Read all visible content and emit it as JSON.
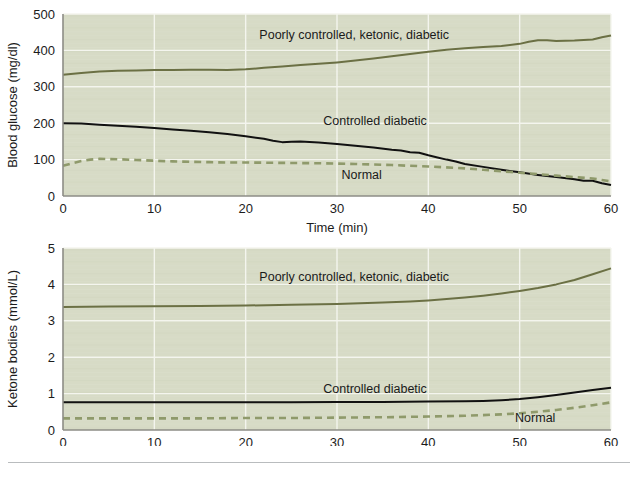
{
  "figure": {
    "background_color": "#ffffff",
    "plot_background_color": "#d7dbc6",
    "gridline_color": "#f4f5ee",
    "axis_color": "#8d8d86",
    "footer_rule_color": "#b9bcbe"
  },
  "series_styles": {
    "poorly_controlled": {
      "color": "#6b7044",
      "width": 2.0,
      "dash": "none"
    },
    "controlled": {
      "color": "#111111",
      "width": 2.0,
      "dash": "none"
    },
    "normal": {
      "color": "#8f9a6b",
      "width": 2.6,
      "dash": "7,5"
    }
  },
  "chart_data": [
    {
      "type": "line",
      "title": "",
      "xlabel": "Time (min)",
      "ylabel": "Blood glucose (mg/dl)",
      "xlim": [
        0,
        60
      ],
      "ylim": [
        0,
        500
      ],
      "xticks": [
        0,
        10,
        20,
        30,
        40,
        50,
        60
      ],
      "yticks": [
        0,
        100,
        200,
        300,
        400,
        500
      ],
      "xtick_labels": [
        "0",
        "10",
        "20",
        "30",
        "40",
        "50",
        "60"
      ],
      "ytick_labels": [
        "0",
        "100",
        "200",
        "300",
        "400",
        "500"
      ],
      "grid": true,
      "grid_axis": "both",
      "legend": "inline-annotations",
      "annotations": [
        {
          "text": "Poorly controlled, ketonic, diabetic",
          "x": 21.5,
          "y": 432,
          "series": "poorly_controlled"
        },
        {
          "text": "Controlled diabetic",
          "x": 28.5,
          "y": 196,
          "series": "controlled"
        },
        {
          "text": "Normal",
          "x": 30.5,
          "y": 48,
          "series": "normal"
        }
      ],
      "series": [
        {
          "name": "Poorly controlled, ketonic, diabetic",
          "style": "poorly_controlled",
          "x": [
            0,
            2,
            4,
            6,
            8,
            10,
            12,
            14,
            16,
            18,
            20,
            22,
            24,
            26,
            28,
            30,
            32,
            34,
            36,
            38,
            40,
            42,
            44,
            46,
            48,
            50,
            51,
            52,
            53,
            54,
            56,
            58,
            59,
            60
          ],
          "values": [
            333,
            338,
            342,
            344,
            345,
            346,
            346,
            347,
            347,
            346,
            348,
            352,
            356,
            360,
            363,
            367,
            372,
            378,
            384,
            390,
            396,
            402,
            406,
            409,
            412,
            418,
            424,
            428,
            428,
            426,
            427,
            430,
            436,
            441
          ]
        },
        {
          "name": "Controlled diabetic",
          "style": "controlled",
          "x": [
            0,
            2,
            4,
            6,
            8,
            10,
            12,
            14,
            16,
            18,
            20,
            22,
            23,
            24,
            25,
            26,
            28,
            30,
            32,
            34,
            36,
            37,
            38,
            39,
            40,
            41,
            42,
            43,
            44,
            46,
            48,
            50,
            52,
            54,
            56,
            57,
            58,
            59,
            60
          ],
          "values": [
            200,
            199,
            196,
            193,
            190,
            187,
            183,
            179,
            175,
            170,
            164,
            157,
            152,
            148,
            149,
            150,
            147,
            143,
            138,
            133,
            127,
            125,
            120,
            119,
            112,
            106,
            100,
            95,
            88,
            80,
            72,
            65,
            58,
            52,
            46,
            42,
            42,
            35,
            30
          ]
        },
        {
          "name": "Normal",
          "style": "normal",
          "x": [
            0,
            1,
            2,
            3,
            4,
            6,
            8,
            10,
            12,
            14,
            16,
            18,
            20,
            24,
            28,
            32,
            36,
            40,
            44,
            46,
            48,
            50,
            52,
            54,
            56,
            58,
            59,
            60
          ],
          "values": [
            83,
            90,
            96,
            100,
            102,
            101,
            99,
            97,
            95,
            94,
            93,
            92,
            92,
            91,
            90,
            88,
            85,
            81,
            76,
            72,
            68,
            64,
            60,
            56,
            52,
            48,
            44,
            40
          ]
        }
      ]
    },
    {
      "type": "line",
      "title": "",
      "xlabel": "Time (min)",
      "ylabel": "Ketone bodies (mmol/L)",
      "xlim": [
        0,
        60
      ],
      "ylim": [
        0,
        5
      ],
      "xticks": [
        0,
        10,
        20,
        30,
        40,
        50,
        60
      ],
      "yticks": [
        0,
        1,
        2,
        3,
        4,
        5
      ],
      "xtick_labels": [
        "0",
        "10",
        "20",
        "30",
        "40",
        "50",
        "60"
      ],
      "ytick_labels": [
        "0",
        "1",
        "2",
        "3",
        "4",
        "5"
      ],
      "grid": true,
      "grid_axis": "both",
      "legend": "inline-annotations",
      "annotations": [
        {
          "text": "Poorly controlled, ketonic, diabetic",
          "x": 21.5,
          "y": 4.09,
          "series": "poorly_controlled"
        },
        {
          "text": "Controlled diabetic",
          "x": 28.5,
          "y": 1.02,
          "series": "controlled"
        },
        {
          "text": "Normal",
          "x": 49.5,
          "y": 0.21,
          "series": "normal"
        }
      ],
      "series": [
        {
          "name": "Poorly controlled, ketonic, diabetic",
          "style": "poorly_controlled",
          "x": [
            0,
            5,
            10,
            15,
            20,
            25,
            30,
            35,
            38,
            40,
            42,
            44,
            46,
            48,
            50,
            52,
            54,
            56,
            58,
            60
          ],
          "values": [
            3.38,
            3.39,
            3.4,
            3.41,
            3.42,
            3.44,
            3.46,
            3.5,
            3.53,
            3.56,
            3.6,
            3.64,
            3.69,
            3.75,
            3.82,
            3.9,
            4.0,
            4.12,
            4.28,
            4.44
          ]
        },
        {
          "name": "Controlled diabetic",
          "style": "controlled",
          "x": [
            0,
            5,
            10,
            15,
            20,
            25,
            30,
            35,
            40,
            44,
            46,
            48,
            50,
            52,
            54,
            56,
            58,
            60
          ],
          "values": [
            0.76,
            0.76,
            0.76,
            0.76,
            0.76,
            0.76,
            0.77,
            0.77,
            0.78,
            0.79,
            0.8,
            0.82,
            0.85,
            0.9,
            0.96,
            1.03,
            1.1,
            1.16
          ]
        },
        {
          "name": "Normal",
          "style": "normal",
          "x": [
            0,
            5,
            10,
            15,
            20,
            25,
            30,
            35,
            40,
            44,
            48,
            50,
            52,
            54,
            56,
            58,
            60
          ],
          "values": [
            0.32,
            0.32,
            0.32,
            0.32,
            0.33,
            0.33,
            0.34,
            0.35,
            0.37,
            0.39,
            0.43,
            0.46,
            0.5,
            0.55,
            0.61,
            0.68,
            0.76
          ]
        }
      ]
    }
  ]
}
